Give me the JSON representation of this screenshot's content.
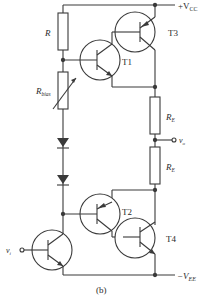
{
  "figure": {
    "caption": "(b)",
    "type": "circuit-schematic"
  },
  "labels": {
    "vcc_sign": "+V",
    "vcc_sub": "CC",
    "vee_sign": "−V",
    "vee_sub": "EE",
    "R": "R",
    "Rbias_main": "R",
    "Rbias_sub": "bias",
    "RE_top_main": "R",
    "RE_top_sub": "E",
    "RE_bot_main": "R",
    "RE_bot_sub": "E",
    "vo_main": "v",
    "vo_sub": "o",
    "vi_main": "v",
    "vi_sub": "i",
    "T1": "T1",
    "T2": "T2",
    "T3": "T3",
    "T4": "T4"
  },
  "components": [
    {
      "id": "R",
      "type": "resistor"
    },
    {
      "id": "Rbias",
      "type": "variable-resistor"
    },
    {
      "id": "D1",
      "type": "diode"
    },
    {
      "id": "D2",
      "type": "diode"
    },
    {
      "id": "T1",
      "type": "npn-transistor"
    },
    {
      "id": "T2",
      "type": "pnp-transistor"
    },
    {
      "id": "T3",
      "type": "pnp-transistor"
    },
    {
      "id": "T4",
      "type": "npn-transistor"
    },
    {
      "id": "T5",
      "type": "npn-transistor",
      "note": "input driver"
    },
    {
      "id": "RE1",
      "type": "resistor"
    },
    {
      "id": "RE2",
      "type": "resistor"
    }
  ],
  "colors": {
    "line": "#3a3a3a",
    "background": "#ffffff"
  }
}
